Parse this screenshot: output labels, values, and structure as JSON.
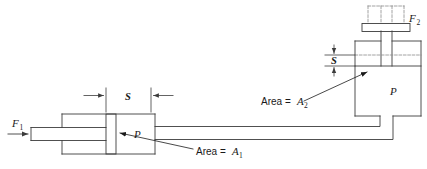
{
  "figure": {
    "type": "engineering-line-diagram",
    "width": 427,
    "height": 169,
    "background_color": "#ffffff",
    "line_color": "#3c3c3c",
    "text_color": "#1a1a1a"
  },
  "labels": {
    "force_input": "F",
    "force_input_sub": "1",
    "force_output": "F",
    "force_output_sub": "2",
    "pressure_left": "P",
    "pressure_right": "P",
    "stroke_left": "S",
    "stroke_right": "S",
    "area_left_text": "Area = ",
    "area_left_symbol": "A",
    "area_left_sub": "1",
    "area_right_text": "Area = ",
    "area_right_symbol": "A",
    "area_right_sub": "2"
  },
  "annotations": {
    "left_cylinder": "small-bore cylinder with piston and rod",
    "right_cylinder": "large-bore cylinder with ram and platen",
    "connecting_pipe": "hydraulic line joining both cylinders",
    "phantom_outline": "dashed outline showing retracted platen position",
    "stroke_dimension_left": "piston travel S on small cylinder",
    "stroke_dimension_right": "ram travel S on large cylinder"
  }
}
